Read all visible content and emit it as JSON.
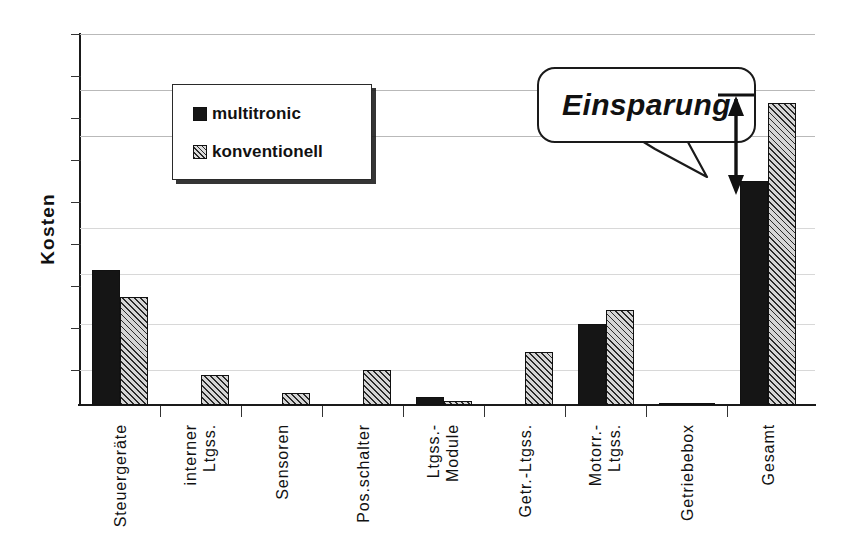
{
  "chart": {
    "type": "bar",
    "title": "",
    "ylabel": "Kosten",
    "xlabel": ""
  },
  "chart_data": {
    "type": "bar",
    "title": "",
    "xlabel": "",
    "ylabel": "Kosten",
    "ylim": [
      0,
      10
    ],
    "grid": true,
    "y_tick_labels": [],
    "legend_position": "upper-left-inside",
    "categories": [
      "Steuergeräte",
      "interner\nLtgss.",
      "Sensoren",
      "Pos.schalter",
      "Ltgss.-\nModule",
      "Getr.-Ltgss.",
      "Motorr.-\nLtgss.",
      "Getriebebox",
      "Gesamt"
    ],
    "series": [
      {
        "name": "multitronic",
        "color": "#151515",
        "pattern": "solid",
        "values": [
          3.65,
          0,
          0,
          0,
          0.22,
          0,
          2.18,
          0.06,
          6.05
        ]
      },
      {
        "name": "konventionell",
        "color": "#d5d5d5",
        "pattern": "diagonal-hatch",
        "values": [
          2.9,
          0.82,
          0.33,
          0.95,
          0.1,
          1.42,
          2.55,
          0.04,
          8.15
        ]
      }
    ],
    "annotations": [
      {
        "name": "einsparung-callout",
        "text": "Einsparung",
        "style": "speech-bubble",
        "points_to": "gesamt-savings-arrow"
      },
      {
        "name": "gesamt-savings-arrow",
        "type": "double-headed-arrow",
        "from_category": "Gesamt",
        "description": "arrow spanning the difference between konventionell and multitronic total cost"
      }
    ]
  },
  "legend": {
    "items": [
      {
        "label": "multitronic"
      },
      {
        "label": "konventionell"
      }
    ]
  },
  "callout": {
    "text": "Einsparung"
  },
  "icons": {
    "legend_swatch_multitronic": "filled-square-icon",
    "legend_swatch_konventionell": "hatched-square-icon",
    "savings_arrow": "double-arrow-icon"
  }
}
